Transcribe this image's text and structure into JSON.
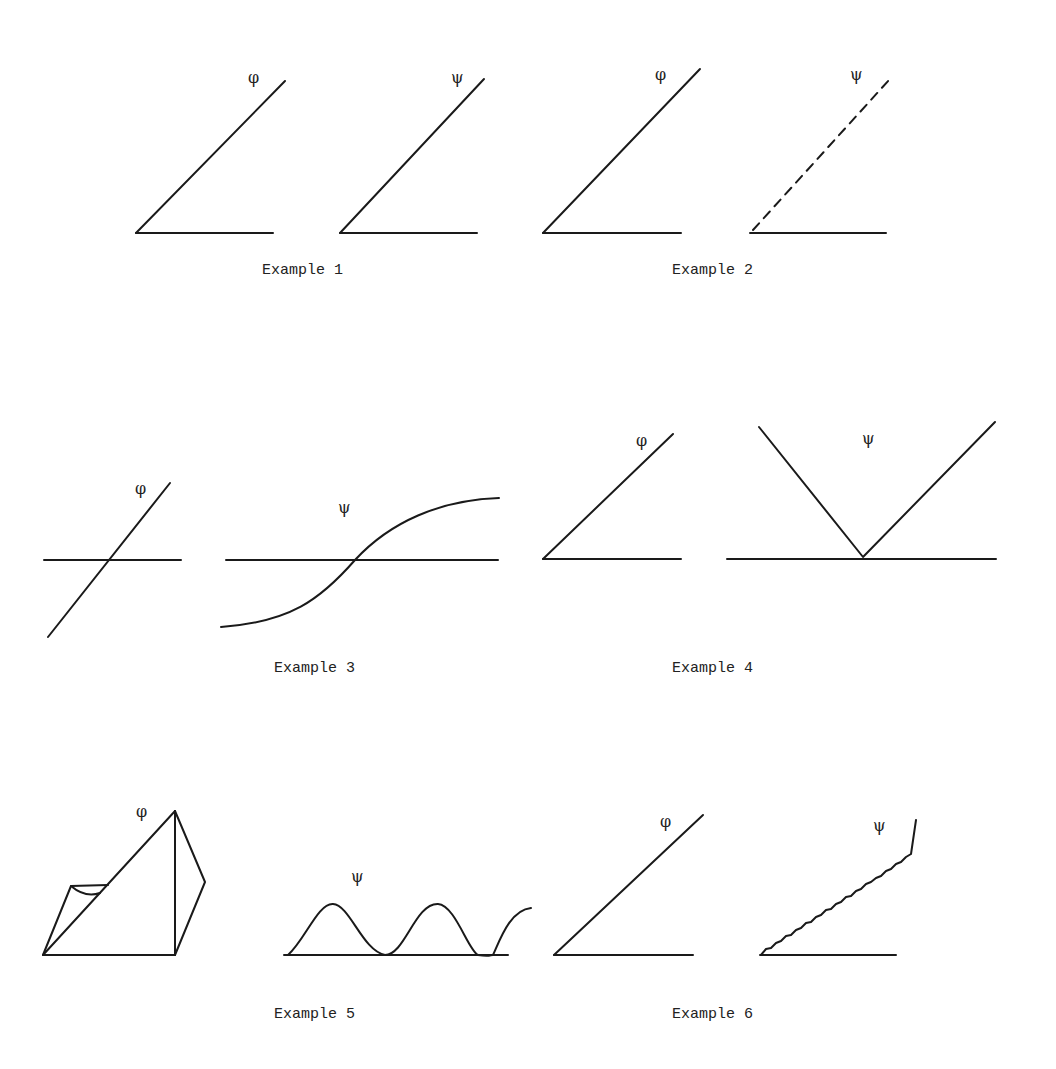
{
  "symbols": {
    "phi": "φ",
    "psi": "ψ"
  },
  "examples": [
    {
      "id": 1,
      "caption": "Example 1",
      "phi_shape": "straight line rising from origin",
      "psi_shape": "straight line rising from origin"
    },
    {
      "id": 2,
      "caption": "Example 2",
      "phi_shape": "straight solid line rising from origin",
      "psi_shape": "straight dashed line rising from origin"
    },
    {
      "id": 3,
      "caption": "Example 3",
      "phi_shape": "straight line crossing horizontal axis",
      "psi_shape": "S-shaped curve crossing horizontal axis"
    },
    {
      "id": 4,
      "caption": "Example 4",
      "phi_shape": "straight line rising from origin",
      "psi_shape": "V shape meeting axis at center"
    },
    {
      "id": 5,
      "caption": "Example 5",
      "phi_shape": "irregular 3D-like wedge figure",
      "psi_shape": "repeated wave humps along axis"
    },
    {
      "id": 6,
      "caption": "Example 6",
      "phi_shape": "straight smooth line rising from origin",
      "psi_shape": "straight jagged line rising from origin"
    }
  ],
  "colors": {
    "ink": "#1a1a1a",
    "background": "#ffffff"
  }
}
